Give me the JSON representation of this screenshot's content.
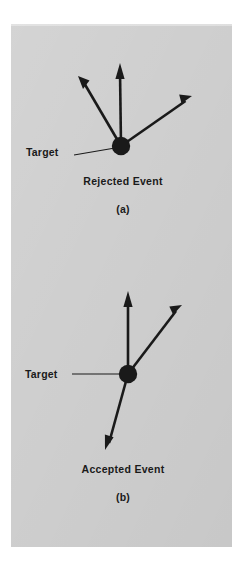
{
  "page": {
    "background_color": "#ffffff",
    "panel_color": "#cfcfcf",
    "ink_color": "#1a1a1a",
    "width": 247,
    "height": 561
  },
  "figures": [
    {
      "id": "a",
      "panel_id_label": "(a)",
      "caption": "Rejected Event",
      "target_label": "Target",
      "vertex": {
        "x": 121,
        "y": 146,
        "r": 9
      },
      "tracks": [
        {
          "name": "track-up-left",
          "tip_x": 78,
          "tip_y": 76
        },
        {
          "name": "track-up",
          "tip_x": 120,
          "tip_y": 63
        },
        {
          "name": "track-up-right",
          "tip_x": 192,
          "tip_y": 96
        }
      ],
      "leader": {
        "from_x": 74,
        "from_y": 155,
        "to_x": 113,
        "to_y": 148
      },
      "target_label_pos": {
        "x": 26,
        "y": 156
      },
      "caption_pos": {
        "x": 123,
        "y": 185
      },
      "panel_id_pos": {
        "x": 123,
        "y": 213
      }
    },
    {
      "id": "b",
      "panel_id_label": "(b)",
      "caption": "Accepted Event",
      "target_label": "Target",
      "vertex": {
        "x": 128,
        "y": 374,
        "r": 9
      },
      "tracks": [
        {
          "name": "track-up",
          "tip_x": 128,
          "tip_y": 291
        },
        {
          "name": "track-up-right",
          "tip_x": 182,
          "tip_y": 305
        },
        {
          "name": "track-down-left",
          "tip_x": 105,
          "tip_y": 450
        }
      ],
      "leader": {
        "from_x": 72,
        "from_y": 374,
        "to_x": 120,
        "to_y": 374
      },
      "target_label_pos": {
        "x": 25,
        "y": 378
      },
      "caption_pos": {
        "x": 123,
        "y": 473
      },
      "panel_id_pos": {
        "x": 123,
        "y": 501
      }
    }
  ]
}
